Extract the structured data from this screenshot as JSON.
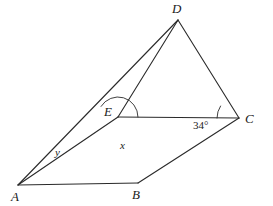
{
  "figure": {
    "kind": "geometry-diagram",
    "stroke_color": "#2a2a2a",
    "background_color": "#ffffff",
    "stroke_width": 1.1
  },
  "points": {
    "A": {
      "label": "A",
      "x": 18,
      "y": 185,
      "label_x": 11,
      "label_y": 190
    },
    "B": {
      "label": "B",
      "x": 138,
      "y": 183,
      "label_x": 132,
      "label_y": 188
    },
    "C": {
      "label": "C",
      "x": 239,
      "y": 118,
      "label_x": 245,
      "label_y": 112
    },
    "D": {
      "label": "D",
      "x": 178,
      "y": 20,
      "label_x": 172,
      "label_y": 2
    },
    "E": {
      "label": "E",
      "x": 118,
      "y": 117,
      "label_x": 104,
      "label_y": 105
    }
  },
  "segments": [
    {
      "name": "segment-AB",
      "from": "A",
      "to": "B"
    },
    {
      "name": "segment-BC",
      "from": "B",
      "to": "C"
    },
    {
      "name": "segment-CD",
      "from": "C",
      "to": "D"
    },
    {
      "name": "segment-DA",
      "from": "D",
      "to": "A"
    },
    {
      "name": "segment-DE",
      "from": "D",
      "to": "E"
    },
    {
      "name": "segment-EC",
      "from": "E",
      "to": "C"
    },
    {
      "name": "segment-EA",
      "from": "E",
      "to": "A"
    }
  ],
  "angles": [
    {
      "name": "angle-x-at-E",
      "label": "x",
      "vertex": "E",
      "label_x": 120,
      "label_y": 140,
      "arc_radius": 20,
      "arc_start_deg": 0,
      "arc_end_deg": 148
    },
    {
      "name": "angle-y-at-A",
      "label": "y",
      "vertex": "A",
      "label_x": 55,
      "label_y": 147,
      "arc_radius": 46,
      "arc_start_deg": -30,
      "arc_end_deg": -48
    },
    {
      "name": "angle-34-at-C",
      "label": "34°",
      "vertex": "C",
      "label_x": 193,
      "label_y": 120,
      "arc_radius": 22,
      "arc_start_deg": 180,
      "arc_end_deg": 147
    }
  ]
}
